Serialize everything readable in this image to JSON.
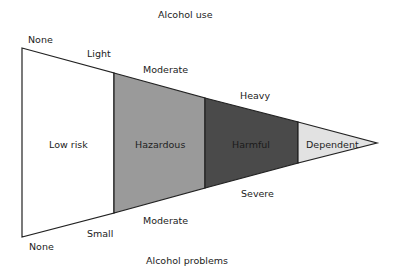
{
  "diagram": {
    "top_axis_title": "Alcohol use",
    "bottom_axis_title": "Alcohol problems",
    "top_labels": [
      "None",
      "Light",
      "Moderate",
      "Heavy"
    ],
    "bottom_labels": [
      "None",
      "Small",
      "Moderate",
      "Severe"
    ],
    "zones": [
      {
        "label": "Low risk",
        "color": "#ffffff"
      },
      {
        "label": "Hazardous",
        "color": "#9a9a9a"
      },
      {
        "label": "Harmful",
        "color": "#4a4a4a"
      },
      {
        "label": "Dependent",
        "color": "#e2e2e2"
      }
    ]
  }
}
